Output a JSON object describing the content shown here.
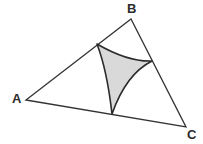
{
  "figure": {
    "background_color": "#ffffff",
    "stroke_color": "#333333",
    "shaded_fill_color": "#d9d9d9",
    "shaded_stroke_color": "#2b2b2b",
    "label_color": "#2b2b2b",
    "outer_stroke_width": 1.3,
    "inner_stroke_width": 1.6,
    "vertices": [
      {
        "name": "A",
        "label": "A",
        "x": 26,
        "y": 100,
        "label_x": 12,
        "label_y": 92
      },
      {
        "name": "B",
        "label": "B",
        "x": 131,
        "y": 19,
        "label_x": 127,
        "label_y": 2
      },
      {
        "name": "C",
        "label": "C",
        "x": 186,
        "y": 127,
        "label_x": 187,
        "label_y": 128
      }
    ],
    "triangle_path": "M 26 100 L 131 19 L 186 127 Z",
    "cusps": [
      {
        "name": "cusp-on-AB",
        "x": 97,
        "y": 44,
        "on_side": "AB"
      },
      {
        "name": "cusp-on-BC",
        "x": 152,
        "y": 61,
        "on_side": "BC"
      },
      {
        "name": "cusp-on-AC",
        "x": 112,
        "y": 114,
        "on_side": "AC"
      }
    ],
    "curved_region_path": "M 97 44 Q 128 62 152 61 Q 126 74 112 114 Q 107 70 97 44 Z",
    "curve_controls": [
      {
        "from": "cusp-on-AB",
        "to": "cusp-on-BC",
        "cx": 128,
        "cy": 62
      },
      {
        "from": "cusp-on-BC",
        "to": "cusp-on-AC",
        "cx": 126,
        "cy": 74
      },
      {
        "from": "cusp-on-AC",
        "to": "cusp-on-AB",
        "cx": 107,
        "cy": 70
      }
    ]
  }
}
